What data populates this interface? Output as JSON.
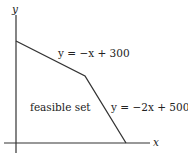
{
  "diagram": {
    "axes": {
      "x_label": "x",
      "y_label": "y"
    },
    "constraints": [
      {
        "label": "y = −x + 300"
      },
      {
        "label": "y = −2x + 500"
      }
    ],
    "region_label": "feasible set",
    "line_color": "#333333"
  }
}
